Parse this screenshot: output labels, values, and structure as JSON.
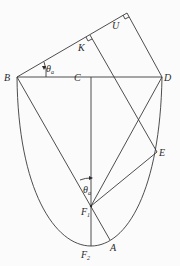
{
  "diagram": {
    "type": "geometry-figure",
    "labels": {
      "B": "B",
      "C": "C",
      "D": "D",
      "K": "K",
      "U": "U",
      "E": "E",
      "F1": "F",
      "F1_sub": "1",
      "F2": "F",
      "F2_sub": "2",
      "A": "A",
      "theta_top": "θ",
      "theta_top_sub": "a",
      "theta_mid": "θ",
      "theta_mid_sub": "a"
    },
    "line_color": "#3a3a3a",
    "background": "#fbfbfb"
  }
}
